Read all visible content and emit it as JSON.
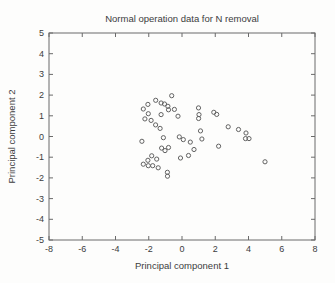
{
  "chart_data": {
    "type": "scatter",
    "title": "Normal operation data for N removal",
    "xlabel": "Principal component 1",
    "ylabel": "Principal component 2",
    "xlim": [
      -8,
      8
    ],
    "ylim": [
      -5,
      5
    ],
    "x_ticks": [
      -8,
      -6,
      -4,
      -2,
      0,
      2,
      4,
      6,
      8
    ],
    "y_ticks": [
      -5,
      -4,
      -3,
      -2,
      -1,
      0,
      1,
      2,
      3,
      4,
      5
    ],
    "grid": false,
    "legend": "none",
    "marker": "open-circle",
    "marker_color": "#626262",
    "axis_color": "#6a6a6a",
    "text_color": "#3c3c3c",
    "points": [
      [
        -0.62,
        1.97
      ],
      [
        -1.58,
        1.75
      ],
      [
        -1.26,
        1.62
      ],
      [
        -1.05,
        1.57
      ],
      [
        -0.85,
        1.46
      ],
      [
        -2.05,
        1.55
      ],
      [
        -2.33,
        1.33
      ],
      [
        -0.81,
        1.29
      ],
      [
        -0.46,
        1.31
      ],
      [
        -2.03,
        1.1
      ],
      [
        -1.26,
        1.06
      ],
      [
        -2.23,
        0.85
      ],
      [
        -1.86,
        0.78
      ],
      [
        -1.59,
        0.56
      ],
      [
        -1.32,
        0.39
      ],
      [
        -0.24,
        0.98
      ],
      [
        -2.41,
        -0.23
      ],
      [
        -1.12,
        -0.06
      ],
      [
        -0.16,
        -0.02
      ],
      [
        0.08,
        -0.15
      ],
      [
        0.5,
        -0.27
      ],
      [
        -1.23,
        -0.56
      ],
      [
        -1.02,
        -0.68
      ],
      [
        -0.81,
        -0.53
      ],
      [
        -1.82,
        -0.93
      ],
      [
        -2.05,
        -1.15
      ],
      [
        -1.52,
        -1.09
      ],
      [
        -2.33,
        -1.34
      ],
      [
        -2.03,
        -1.41
      ],
      [
        -1.76,
        -1.41
      ],
      [
        -1.43,
        -1.51
      ],
      [
        -0.88,
        -1.73
      ],
      [
        -0.87,
        -1.92
      ],
      [
        -0.09,
        -1.04
      ],
      [
        0.39,
        -0.92
      ],
      [
        0.72,
        -0.63
      ],
      [
        0.99,
        1.38
      ],
      [
        1.02,
        1.06
      ],
      [
        1.0,
        0.87
      ],
      [
        1.91,
        1.17
      ],
      [
        2.09,
        1.07
      ],
      [
        1.11,
        0.27
      ],
      [
        1.2,
        -0.12
      ],
      [
        2.2,
        -0.47
      ],
      [
        2.78,
        0.47
      ],
      [
        3.4,
        0.34
      ],
      [
        3.85,
        0.17
      ],
      [
        3.82,
        -0.1
      ],
      [
        4.03,
        -0.1
      ],
      [
        4.99,
        -1.22
      ]
    ]
  }
}
